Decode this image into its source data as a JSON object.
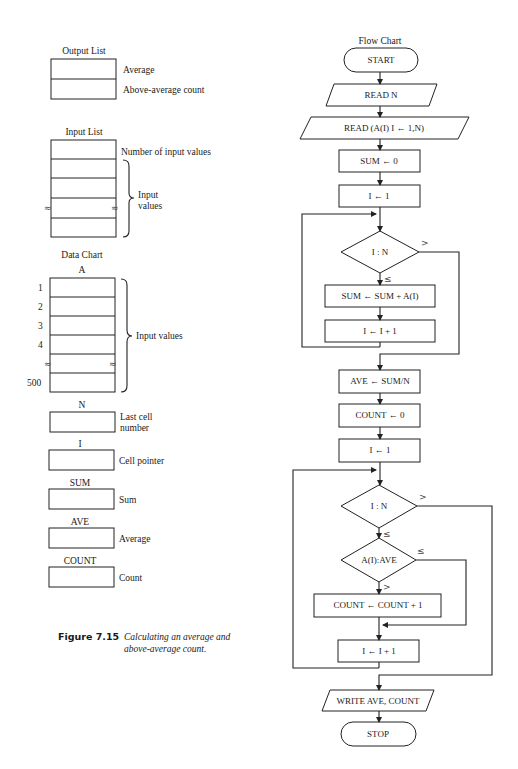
{
  "output_list": {
    "title": "Output List",
    "rows": [
      {
        "label": "Average"
      },
      {
        "label": "Above-average count"
      }
    ]
  },
  "input_list": {
    "title": "Input List",
    "first_label": "Number of input values",
    "brace_label_line1": "Input",
    "brace_label_line2": "values",
    "break_symbol": "≈"
  },
  "data_chart": {
    "title": "Data Chart",
    "array_name": "A",
    "indices": [
      "1",
      "2",
      "3",
      "4",
      "500"
    ],
    "brace_label": "Input values",
    "break_symbol": "≈",
    "variables": [
      {
        "name": "N",
        "desc_line1": "Last cell",
        "desc_line2": "number"
      },
      {
        "name": "I",
        "desc_line1": "Cell pointer",
        "desc_line2": ""
      },
      {
        "name": "SUM",
        "desc_line1": "Sum",
        "desc_line2": ""
      },
      {
        "name": "AVE",
        "desc_line1": "Average",
        "desc_line2": ""
      },
      {
        "name": "COUNT",
        "desc_line1": "Count",
        "desc_line2": ""
      }
    ]
  },
  "caption": {
    "figure_number": "Figure 7.15",
    "line1": "Calculating an average and",
    "line2": "above-average count."
  },
  "flow_chart": {
    "title": "Flow Chart",
    "steps": {
      "start": "START",
      "read_n": "READ N",
      "read_a": "READ (A(I) I ← 1,N)",
      "sum_init": "SUM ← 0",
      "i_init_1": "I ← 1",
      "cond_1": "I : N",
      "sum_add": "SUM ← SUM + A(I)",
      "i_inc_1": "I ← I + 1",
      "ave_calc": "AVE ← SUM/N",
      "count_init": "COUNT ← 0",
      "i_init_2": "I ← 1",
      "cond_2": "I : N",
      "cond_3": "A(I):AVE",
      "count_inc": "COUNT ← COUNT + 1",
      "i_inc_2": "I ← I + 1",
      "write": "WRITE AVE, COUNT",
      "stop": "STOP"
    },
    "branch_labels": {
      "cond_1_gt": ">",
      "cond_1_le": "≤",
      "cond_2_gt": ">",
      "cond_2_le": "≤",
      "cond_3_le": "≤",
      "cond_3_gt": ">"
    }
  }
}
